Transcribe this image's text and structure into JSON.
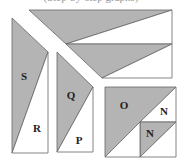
{
  "caption": "(Step-by-step graphs)",
  "colors": {
    "shaded": "#b4b4b4",
    "unshaded": "#ffffff",
    "stroke": "#666666"
  },
  "pieces": {
    "top_trapezoid": {
      "regions": [
        {
          "shade": "shaded",
          "points": "29,10 172,10 66,44"
        },
        {
          "shade": "unshaded",
          "points": "172,10 172,44 66,44"
        },
        {
          "shade": "shaded",
          "points": "66,44 172,44 102,78"
        },
        {
          "shade": "unshaded",
          "points": "172,44 172,78 102,78"
        }
      ]
    },
    "left_piece": {
      "regions": [
        {
          "shade": "shaded",
          "points": "12,18 48,52 12,153",
          "label": "S",
          "lx": 24,
          "ly": 77
        },
        {
          "shade": "unshaded",
          "points": "48,52 48,153 12,153",
          "label": "R",
          "lx": 37,
          "ly": 129
        }
      ]
    },
    "middle_piece": {
      "regions": [
        {
          "shade": "shaded",
          "points": "57,52 93,87 57,152",
          "label": "Q",
          "lx": 71,
          "ly": 96
        },
        {
          "shade": "unshaded",
          "points": "93,87 93,152 57,152",
          "label": "P",
          "lx": 79,
          "ly": 141
        }
      ]
    },
    "square_piece": {
      "regions": [
        {
          "shade": "shaded",
          "points": "105,87 176,87 105,157",
          "label": "O",
          "lx": 124,
          "ly": 106
        },
        {
          "shade": "unshaded",
          "points": "176,87 176,122 140,122",
          "label": "N",
          "lx": 164,
          "ly": 112
        },
        {
          "shade": "shaded",
          "points": "140,122 176,122 140,157",
          "label": "N",
          "lx": 150,
          "ly": 134
        },
        {
          "shade": "unshaded",
          "points": "176,122 176,157 140,157"
        },
        {
          "shade": "unshaded",
          "points": "105,157 140,122 140,157"
        }
      ]
    }
  },
  "labels": [
    "S",
    "R",
    "Q",
    "P",
    "O",
    "N",
    "N"
  ]
}
